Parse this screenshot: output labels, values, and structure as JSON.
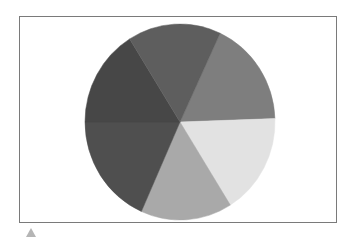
{
  "chart_data": {
    "type": "pie",
    "title": "",
    "legend": [],
    "slices": [
      {
        "name": "slice-1",
        "angle_deg": 63,
        "percent": 17.5,
        "color": "#7e7e7e"
      },
      {
        "name": "slice-2",
        "angle_deg": 60,
        "percent": 16.7,
        "color": "#e2e2e2"
      },
      {
        "name": "slice-3",
        "angle_deg": 56,
        "percent": 15.6,
        "color": "#a9a9a9"
      },
      {
        "name": "slice-4",
        "angle_deg": 66,
        "percent": 18.3,
        "color": "#4f4f4f"
      },
      {
        "name": "slice-5",
        "angle_deg": 58,
        "percent": 16.1,
        "color": "#474747"
      },
      {
        "name": "slice-6",
        "angle_deg": 57,
        "percent": 15.8,
        "color": "#5e5e5e"
      }
    ],
    "start_angle_deg": 25,
    "direction": "clockwise",
    "labels_shown": false,
    "center": [
      180,
      122
    ],
    "radius": [
      95,
      98
    ]
  },
  "frame": {
    "border_color": "#7a7a7a"
  },
  "marker": {
    "color": "#b5b5b5",
    "shape": "triangle-up"
  }
}
